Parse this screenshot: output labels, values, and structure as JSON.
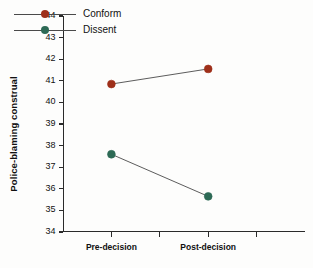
{
  "chart_data": {
    "type": "line",
    "title": "",
    "xlabel": "",
    "ylabel": "Police-blaming construal",
    "categories": [
      "Pre-decision",
      "Post-decision"
    ],
    "ylim": [
      34,
      44
    ],
    "yticks": [
      34,
      35,
      36,
      37,
      38,
      39,
      40,
      41,
      42,
      43,
      44
    ],
    "ytick_labels": [
      "34",
      "35",
      "36",
      "37",
      "38",
      "39",
      "40",
      "41",
      "42",
      "43",
      "44"
    ],
    "grid": false,
    "legend_position": "upper left",
    "series": [
      {
        "name": "Conform",
        "color": "#9E2F1A",
        "values": [
          40.85,
          41.55
        ]
      },
      {
        "name": "Dissent",
        "color": "#2D6A55",
        "values": [
          37.6,
          35.65
        ]
      }
    ],
    "xtick_count": 4,
    "category_tick_index": [
      0,
      2
    ]
  },
  "axis": {
    "y_title": "Police-blaming construal"
  },
  "legend": {
    "items": [
      {
        "label": "Conform",
        "color": "#9E2F1A"
      },
      {
        "label": "Dissent",
        "color": "#2D6A55"
      }
    ]
  }
}
